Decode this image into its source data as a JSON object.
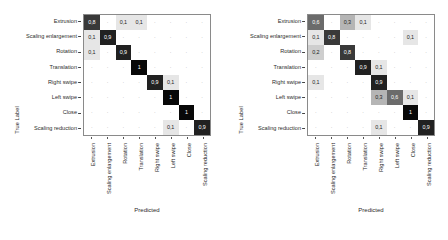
{
  "figure": {
    "panels": [
      {
        "id": "left",
        "xlabel": "Predicted",
        "ylabel": "True Label"
      },
      {
        "id": "right",
        "xlabel": "Predicted",
        "ylabel": "True Label"
      }
    ]
  },
  "chart_data": [
    {
      "type": "heatmap",
      "title": "",
      "xlabel": "Predicted",
      "ylabel": "True Label",
      "categories": [
        "Extrusion",
        "Scaling enlargement",
        "Rotation",
        "Translation",
        "Right swipe",
        "Left swipe",
        "Close",
        "Scaling reduction"
      ],
      "xtick_labels": [
        "Extrusion",
        "Scaling enlargement",
        "Rotation",
        "Translation",
        "Right swipe",
        "Left swipe",
        "Close",
        "Scaling reduction"
      ],
      "ytick_labels": [
        "Extrusion",
        "Scaling enlargement",
        "Rotation",
        "Translation",
        "Right swipe",
        "Left swipe",
        "Close",
        "Scaling reduction"
      ],
      "zlim": [
        0,
        1
      ],
      "colormap": "greys",
      "grid": true,
      "legend": "none",
      "values": [
        [
          0.8,
          0.0,
          0.1,
          0.1,
          0.0,
          0.0,
          0.0,
          0.0
        ],
        [
          0.1,
          0.9,
          0.0,
          0.0,
          0.0,
          0.0,
          0.0,
          0.0
        ],
        [
          0.1,
          0.0,
          0.9,
          0.0,
          0.0,
          0.0,
          0.0,
          0.0
        ],
        [
          0.0,
          0.0,
          0.0,
          1.0,
          0.0,
          0.0,
          0.0,
          0.0
        ],
        [
          0.0,
          0.0,
          0.0,
          0.0,
          0.9,
          0.1,
          0.0,
          0.0
        ],
        [
          0.0,
          0.0,
          0.0,
          0.0,
          0.0,
          1.0,
          0.0,
          0.0
        ],
        [
          0.0,
          0.0,
          0.0,
          0.0,
          0.0,
          0.0,
          1.0,
          0.0
        ],
        [
          0.0,
          0.0,
          0.0,
          0.0,
          0.0,
          0.1,
          0.0,
          0.9
        ]
      ],
      "labels": [
        [
          "0,8",
          "",
          "0,1",
          "0,1",
          "",
          "",
          "",
          ""
        ],
        [
          "0,1",
          "0,9",
          "",
          "",
          "",
          "",
          "",
          ""
        ],
        [
          "0,1",
          "",
          "0,9",
          "",
          "",
          "",
          "",
          ""
        ],
        [
          "",
          "",
          "",
          "1",
          "",
          "",
          "",
          ""
        ],
        [
          "",
          "",
          "",
          "",
          "0,9",
          "0,1",
          "",
          ""
        ],
        [
          "",
          "",
          "",
          "",
          "",
          "1",
          "",
          ""
        ],
        [
          "",
          "",
          "",
          "",
          "",
          "",
          "1",
          ""
        ],
        [
          "",
          "",
          "",
          "",
          "",
          "0,1",
          "",
          "0,9"
        ]
      ]
    },
    {
      "type": "heatmap",
      "title": "",
      "xlabel": "Predicted",
      "ylabel": "True Label",
      "categories": [
        "Extrusion",
        "Scaling enlargement",
        "Rotation",
        "Translation",
        "Right swipe",
        "Left swipe",
        "Close",
        "Scaling reduction"
      ],
      "xtick_labels": [
        "Extrusion",
        "Scaling enlargement",
        "Rotation",
        "Translation",
        "Right swipe",
        "Left swipe",
        "Close",
        "Scaling reduction"
      ],
      "ytick_labels": [
        "Extrusion",
        "Scaling enlargement",
        "Rotation",
        "Translation",
        "Right swipe",
        "Left swipe",
        "Close",
        "Scaling reduction"
      ],
      "zlim": [
        0,
        1
      ],
      "colormap": "greys",
      "grid": true,
      "legend": "none",
      "values": [
        [
          0.6,
          0.0,
          0.3,
          0.1,
          0.0,
          0.0,
          0.0,
          0.0
        ],
        [
          0.1,
          0.8,
          0.0,
          0.0,
          0.0,
          0.0,
          0.1,
          0.0
        ],
        [
          0.2,
          0.0,
          0.8,
          0.0,
          0.0,
          0.0,
          0.0,
          0.0
        ],
        [
          0.0,
          0.0,
          0.0,
          0.9,
          0.1,
          0.0,
          0.0,
          0.0
        ],
        [
          0.1,
          0.0,
          0.0,
          0.0,
          0.9,
          0.0,
          0.0,
          0.0
        ],
        [
          0.0,
          0.0,
          0.0,
          0.0,
          0.3,
          0.6,
          0.1,
          0.0
        ],
        [
          0.0,
          0.0,
          0.0,
          0.0,
          0.0,
          0.0,
          1.0,
          0.0
        ],
        [
          0.0,
          0.0,
          0.0,
          0.0,
          0.1,
          0.0,
          0.0,
          0.9
        ]
      ],
      "labels": [
        [
          "0,6",
          "",
          "0,3",
          "0,1",
          "",
          "",
          "",
          ""
        ],
        [
          "0,1",
          "0,8",
          "",
          "",
          "",
          "",
          "0,1",
          ""
        ],
        [
          "0,2",
          "",
          "0,8",
          "",
          "",
          "",
          "",
          ""
        ],
        [
          "",
          "",
          "",
          "0,9",
          "0,1",
          "",
          "",
          ""
        ],
        [
          "0,1",
          "",
          "",
          "",
          "0,9",
          "",
          "",
          ""
        ],
        [
          "",
          "",
          "",
          "",
          "0,3",
          "0,6",
          "0,1",
          ""
        ],
        [
          "",
          "",
          "",
          "",
          "",
          "",
          "1",
          ""
        ],
        [
          "",
          "",
          "",
          "",
          "0,1",
          "",
          "",
          "0,9"
        ]
      ]
    }
  ]
}
